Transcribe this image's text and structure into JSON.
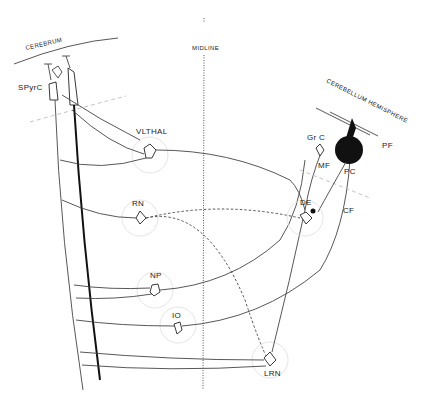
{
  "diagram": {
    "type": "neuroanatomy-circuit",
    "labels": {
      "cerebrum": "CEREBRUM",
      "midline": "MIDLINE",
      "cerebellum_hemisphere": "CEREBELLUM  HEMISPHERE",
      "spyrc": "SPyrC",
      "vlthal": "VLTHAL",
      "rn": "RN",
      "np": "NP",
      "io": "IO",
      "lrn": "LRN",
      "grc": "Gr C",
      "mf": "MF",
      "pc": "PC",
      "pf": "PF",
      "de": "DE",
      "cf": "CF"
    },
    "nodes": [
      {
        "id": "SPyrC",
        "label": "SPyrC",
        "region": "cerebrum"
      },
      {
        "id": "VLTHAL",
        "label": "VLTHAL"
      },
      {
        "id": "RN",
        "label": "RN"
      },
      {
        "id": "NP",
        "label": "NP"
      },
      {
        "id": "IO",
        "label": "IO"
      },
      {
        "id": "LRN",
        "label": "LRN"
      },
      {
        "id": "GrC",
        "label": "Gr C",
        "region": "cerebellum"
      },
      {
        "id": "PC",
        "label": "PC",
        "region": "cerebellum"
      },
      {
        "id": "DE",
        "label": "DE"
      }
    ],
    "edges": [
      {
        "from": "SPyrC",
        "to": "VLTHAL"
      },
      {
        "from": "SPyrC",
        "to": "RN"
      },
      {
        "from": "SPyrC",
        "to": "NP"
      },
      {
        "from": "SPyrC",
        "to": "IO"
      },
      {
        "from": "SPyrC",
        "to": "LRN"
      },
      {
        "from": "VLTHAL",
        "to": "SPyrC"
      },
      {
        "from": "DE",
        "to": "VLTHAL"
      },
      {
        "from": "DE",
        "to": "RN",
        "style": "dashed"
      },
      {
        "from": "RN",
        "to": "LRN",
        "style": "dashed"
      },
      {
        "from": "NP",
        "to": "GrC",
        "label": "MF"
      },
      {
        "from": "LRN",
        "to": "GrC",
        "label": "MF"
      },
      {
        "from": "IO",
        "to": "PC",
        "label": "CF"
      },
      {
        "from": "GrC",
        "to": "PC",
        "label": "PF"
      },
      {
        "from": "PC",
        "to": "DE"
      }
    ]
  }
}
